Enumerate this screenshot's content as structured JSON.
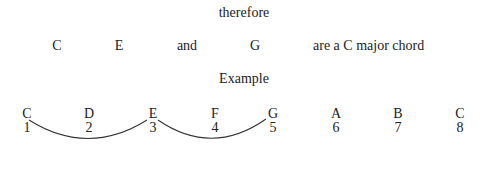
{
  "heading": "therefore",
  "statement": {
    "notes": [
      "C",
      "E",
      "G"
    ],
    "conjunction": "and",
    "conclusion": "are a C major chord"
  },
  "example_label": "Example",
  "scale": {
    "notes": [
      "C",
      "D",
      "E",
      "F",
      "G",
      "A",
      "B",
      "C"
    ],
    "degrees": [
      "1",
      "2",
      "3",
      "4",
      "5",
      "6",
      "7",
      "8"
    ]
  },
  "arcs": [
    {
      "from_degree": "1",
      "to_degree": "3"
    },
    {
      "from_degree": "3",
      "to_degree": "5"
    }
  ]
}
